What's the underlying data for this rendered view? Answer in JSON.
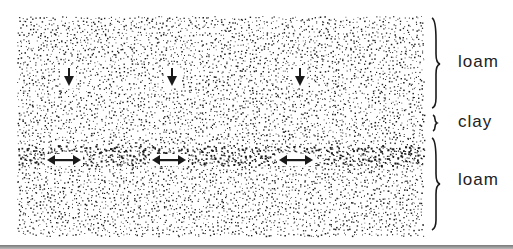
{
  "diagram": {
    "type": "soil-profile",
    "layers": [
      {
        "name": "upper-loam",
        "label": "loam",
        "texture": "fine stipple"
      },
      {
        "name": "clay",
        "label": "clay",
        "texture": "dense stipple band"
      },
      {
        "name": "lower-loam",
        "label": "loam",
        "texture": "fine stipple"
      }
    ],
    "annotations": {
      "down_arrows": {
        "count": 3,
        "meaning": "downward water movement",
        "x": [
          69,
          172,
          300
        ]
      },
      "lateral_arrows": {
        "count": 3,
        "meaning": "lateral water movement along clay layer",
        "x": [
          64,
          169,
          296
        ]
      }
    },
    "colors": {
      "ink": "#1a1a1a",
      "background": "#ffffff",
      "rule": "#8a8a8a"
    }
  },
  "labels": {
    "upper": "loam",
    "middle": "clay",
    "lower": "loam"
  }
}
